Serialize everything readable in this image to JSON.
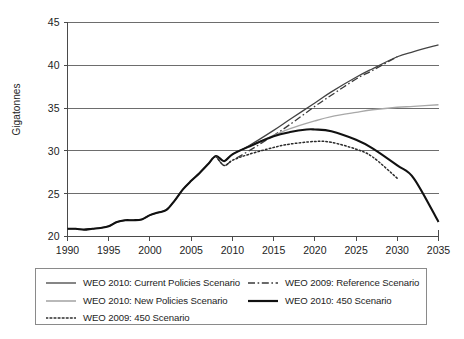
{
  "chart_data": {
    "type": "line",
    "title": "",
    "xlabel": "",
    "ylabel": "Gigatonnes",
    "xlim": [
      1990,
      2035
    ],
    "ylim": [
      20,
      45
    ],
    "xticks": [
      1990,
      1995,
      2000,
      2005,
      2010,
      2015,
      2020,
      2025,
      2030,
      2035
    ],
    "yticks": [
      20,
      25,
      30,
      35,
      40,
      45
    ],
    "grid": "horizontal",
    "legend_position": "bottom",
    "series": [
      {
        "name": "WEO 2010: Current Policies Scenario",
        "style": "solid",
        "color": "#444444",
        "width": 1.3,
        "x": [
          1990,
          1991,
          1992,
          1993,
          1994,
          1995,
          1996,
          1997,
          1998,
          1999,
          2000,
          2001,
          2002,
          2003,
          2004,
          2005,
          2006,
          2007,
          2008,
          2009,
          2010,
          2012,
          2015,
          2017,
          2020,
          2022,
          2025,
          2027,
          2030,
          2032,
          2035
        ],
        "y": [
          20.9,
          20.9,
          20.8,
          20.9,
          21.0,
          21.2,
          21.7,
          21.9,
          21.9,
          22.0,
          22.5,
          22.8,
          23.1,
          24.2,
          25.5,
          26.5,
          27.4,
          28.4,
          29.4,
          28.8,
          29.6,
          30.6,
          32.4,
          33.7,
          35.6,
          36.9,
          38.6,
          39.6,
          41.0,
          41.6,
          42.4
        ]
      },
      {
        "name": "WEO 2009: Reference Scenario",
        "style": "dashdot",
        "color": "#3a3a3a",
        "width": 1.3,
        "x": [
          2008,
          2009,
          2010,
          2012,
          2015,
          2017,
          2020,
          2022,
          2025,
          2027,
          2030
        ],
        "y": [
          29.4,
          28.3,
          28.9,
          30.0,
          31.8,
          33.1,
          35.2,
          36.5,
          38.4,
          39.4,
          41.0
        ]
      },
      {
        "name": "WEO 2010: New Policies Scenario",
        "style": "solid",
        "color": "#a8a8a8",
        "width": 1.4,
        "x": [
          2008,
          2009,
          2010,
          2012,
          2015,
          2017,
          2020,
          2022,
          2025,
          2027,
          2030,
          2032,
          2035
        ],
        "y": [
          29.4,
          28.8,
          29.6,
          30.5,
          31.8,
          32.6,
          33.5,
          34.0,
          34.5,
          34.8,
          35.1,
          35.2,
          35.4
        ]
      },
      {
        "name": "WEO 2010: 450 Scenario",
        "style": "solid",
        "color": "#111111",
        "width": 2.1,
        "x": [
          1990,
          1991,
          1992,
          1993,
          1994,
          1995,
          1996,
          1997,
          1998,
          1999,
          2000,
          2001,
          2002,
          2003,
          2004,
          2005,
          2006,
          2007,
          2008,
          2009,
          2010,
          2012,
          2015,
          2017,
          2019,
          2020,
          2022,
          2025,
          2027,
          2030,
          2032,
          2035
        ],
        "y": [
          20.9,
          20.9,
          20.8,
          20.9,
          21.0,
          21.2,
          21.7,
          21.9,
          21.9,
          22.0,
          22.5,
          22.8,
          23.1,
          24.2,
          25.5,
          26.5,
          27.4,
          28.4,
          29.4,
          28.8,
          29.6,
          30.5,
          31.7,
          32.2,
          32.5,
          32.5,
          32.3,
          31.3,
          30.3,
          28.3,
          26.8,
          21.7
        ]
      },
      {
        "name": "WEO 2009: 450 Scenario",
        "style": "dotted",
        "color": "#2b2b2b",
        "width": 1.5,
        "x": [
          2008,
          2009,
          2010,
          2012,
          2015,
          2017,
          2020,
          2022,
          2025,
          2027,
          2030
        ],
        "y": [
          29.4,
          28.3,
          28.9,
          29.6,
          30.4,
          30.8,
          31.1,
          31.0,
          30.2,
          29.3,
          26.8
        ]
      }
    ]
  },
  "legend": {
    "items": [
      {
        "label": "WEO 2010: Current Policies Scenario",
        "style": "solid",
        "color": "#444444",
        "width": 1.3
      },
      {
        "label": "WEO 2009: Reference Scenario",
        "style": "dashdot",
        "color": "#3a3a3a",
        "width": 1.3
      },
      {
        "label": "WEO 2010: New Policies Scenario",
        "style": "solid",
        "color": "#a8a8a8",
        "width": 1.6
      },
      {
        "label": "WEO 2010: 450 Scenario",
        "style": "solid",
        "color": "#111111",
        "width": 2.2
      },
      {
        "label": "WEO 2009: 450 Scenario",
        "style": "dotted",
        "color": "#2b2b2b",
        "width": 1.6
      }
    ]
  },
  "axis": {
    "y_title": "Gigatonnes"
  }
}
